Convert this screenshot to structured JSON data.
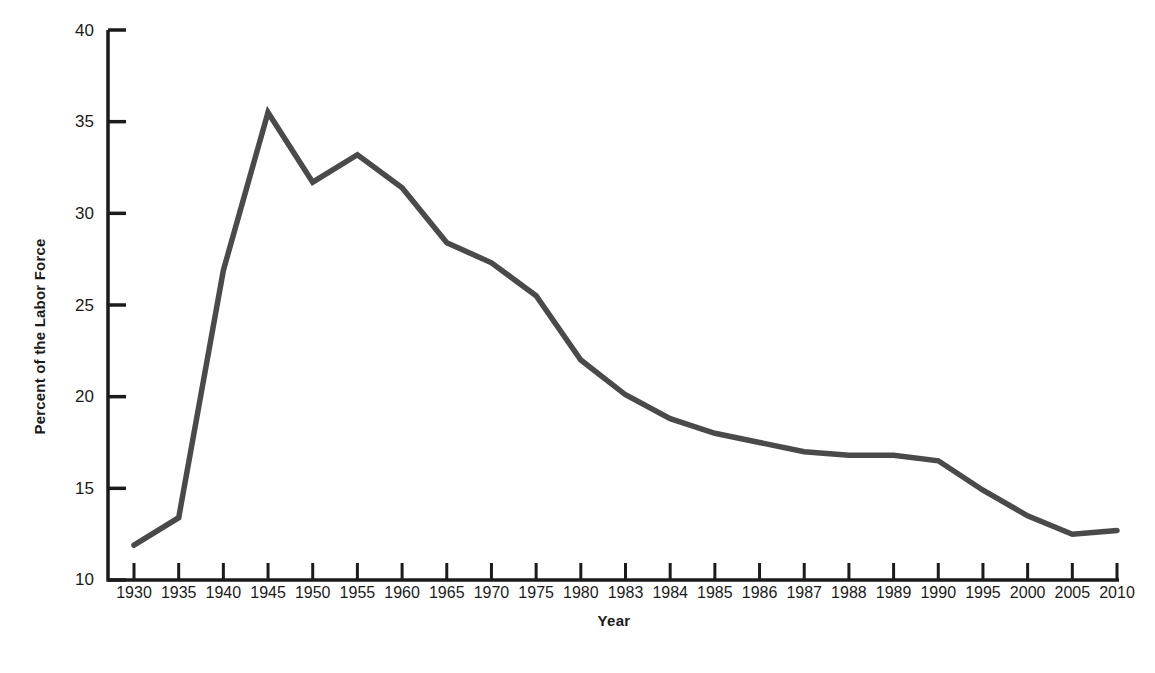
{
  "chart_data": {
    "type": "line",
    "title": "",
    "xlabel": "Year",
    "ylabel": "Percent of the Labor Force",
    "categories": [
      "1930",
      "1935",
      "1940",
      "1945",
      "1950",
      "1955",
      "1960",
      "1965",
      "1970",
      "1975",
      "1980",
      "1983",
      "1984",
      "1985",
      "1986",
      "1987",
      "1988",
      "1989",
      "1990",
      "1995",
      "2000",
      "2005",
      "2010"
    ],
    "values": [
      11.9,
      13.4,
      26.9,
      35.5,
      31.7,
      33.2,
      31.4,
      28.4,
      27.3,
      25.5,
      22.0,
      20.1,
      18.8,
      18.0,
      17.5,
      17.0,
      16.8,
      16.8,
      16.5,
      14.9,
      13.5,
      12.5,
      12.7
    ],
    "ylim": [
      10,
      40
    ],
    "yticks": [
      10,
      15,
      20,
      25,
      30,
      35,
      40
    ],
    "ytick_labels": [
      "10",
      "15",
      "20",
      "25",
      "30",
      "35",
      "40"
    ],
    "grid": false,
    "legend": "none",
    "line_color": "#4a4a4a",
    "axis_color": "#1b1b1b",
    "background_color": "#ffffff"
  }
}
